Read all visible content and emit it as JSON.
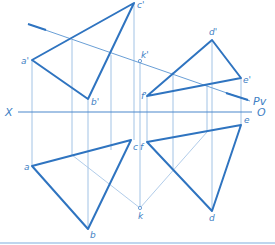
{
  "diagram": {
    "colors": {
      "thick": "#2f74c0",
      "thin": "#8bb4de",
      "axis": "#4b88cc",
      "label": "#3f7fc4",
      "border": "#a9c8e8"
    },
    "axis": {
      "left_label": "X",
      "right_label": "O",
      "plane_label": "Pv"
    },
    "front_view": {
      "triangle_abc": {
        "a": "a'",
        "b": "b'",
        "c": "c'"
      },
      "triangle_def": {
        "d": "d'",
        "e": "e'",
        "f": "f'"
      },
      "point_k": "k'"
    },
    "top_view": {
      "triangle_abc": {
        "a": "a",
        "b": "b",
        "c": "c"
      },
      "triangle_def": {
        "d": "d",
        "e": "e",
        "f": "f"
      },
      "point_k": "k"
    }
  }
}
